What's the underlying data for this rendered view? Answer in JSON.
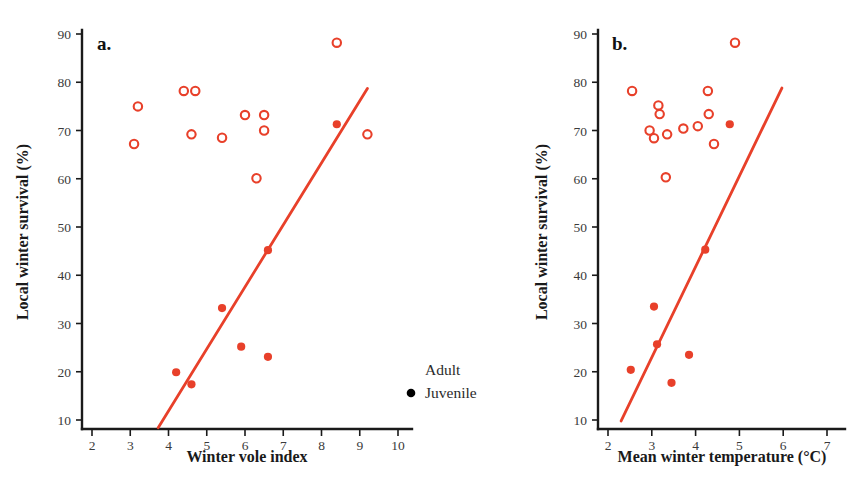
{
  "figure": {
    "accent_color": "#E8402A",
    "axis_color": "#1a1a1a",
    "text_color": "#2b2b2b"
  },
  "legend": {
    "adult_label": "Adult",
    "juvenile_label": "Juvenile",
    "adult_marker": "open-circle",
    "juvenile_marker": "filled-circle"
  },
  "chart_data": [
    {
      "type": "scatter",
      "panel": "a.",
      "title": "",
      "xlabel": "Winter vole index",
      "ylabel": "Local winter survival (%)",
      "xlim": [
        1.6,
        10.4
      ],
      "ylim": [
        8,
        92
      ],
      "xticks": [
        2,
        3,
        4,
        5,
        6,
        7,
        8,
        9,
        10
      ],
      "xticklabels": [
        "2",
        "3",
        "4",
        "5",
        "6",
        "7",
        "8",
        "9",
        "10"
      ],
      "yticks": [
        10,
        20,
        30,
        40,
        50,
        60,
        70,
        80,
        90
      ],
      "yticklabels": [
        "10",
        "20",
        "30",
        "40",
        "50",
        "60",
        "70",
        "80",
        "90"
      ],
      "grid": false,
      "legend_position": "outside-right",
      "series": [
        {
          "name": "Adult",
          "marker": "open-circle",
          "color": "#E8402A",
          "points": [
            {
              "x": 3.1,
              "y": 67.2
            },
            {
              "x": 3.2,
              "y": 75.0
            },
            {
              "x": 4.4,
              "y": 78.2
            },
            {
              "x": 4.7,
              "y": 78.2
            },
            {
              "x": 4.6,
              "y": 69.2
            },
            {
              "x": 5.4,
              "y": 68.5
            },
            {
              "x": 6.0,
              "y": 73.2
            },
            {
              "x": 6.5,
              "y": 73.2
            },
            {
              "x": 6.5,
              "y": 70.0
            },
            {
              "x": 6.3,
              "y": 60.1
            },
            {
              "x": 8.4,
              "y": 88.2
            },
            {
              "x": 9.2,
              "y": 69.2
            }
          ]
        },
        {
          "name": "Juvenile",
          "marker": "filled-circle",
          "color": "#E8402A",
          "points": [
            {
              "x": 4.2,
              "y": 19.9
            },
            {
              "x": 4.6,
              "y": 17.4
            },
            {
              "x": 5.4,
              "y": 33.2
            },
            {
              "x": 5.9,
              "y": 25.2
            },
            {
              "x": 6.6,
              "y": 23.1
            },
            {
              "x": 6.6,
              "y": 45.2
            },
            {
              "x": 8.4,
              "y": 71.3
            }
          ]
        }
      ],
      "fit_line": {
        "x1": 3.73,
        "y1": 8.4,
        "x2": 9.2,
        "y2": 78.7
      }
    },
    {
      "type": "scatter",
      "panel": "b.",
      "title": "",
      "xlabel": "Mean winter temperature (°C)",
      "ylabel": "Local winter survival (%)",
      "xlim": [
        1.75,
        7.5
      ],
      "ylim": [
        8,
        92
      ],
      "xticks": [
        2,
        3,
        4,
        5,
        6,
        7
      ],
      "xticklabels": [
        "2",
        "3",
        "4",
        "5",
        "6",
        "7"
      ],
      "yticks": [
        10,
        20,
        30,
        40,
        50,
        60,
        70,
        80,
        90
      ],
      "yticklabels": [
        "10",
        "20",
        "30",
        "40",
        "50",
        "60",
        "70",
        "80",
        "90"
      ],
      "grid": false,
      "legend_position": "outside-left",
      "series": [
        {
          "name": "Adult",
          "marker": "open-circle",
          "color": "#E8402A",
          "points": [
            {
              "x": 2.55,
              "y": 78.2
            },
            {
              "x": 3.15,
              "y": 75.2
            },
            {
              "x": 3.18,
              "y": 73.4
            },
            {
              "x": 2.95,
              "y": 70.0
            },
            {
              "x": 3.05,
              "y": 68.4
            },
            {
              "x": 3.35,
              "y": 69.2
            },
            {
              "x": 3.32,
              "y": 60.3
            },
            {
              "x": 3.72,
              "y": 70.4
            },
            {
              "x": 4.05,
              "y": 70.9
            },
            {
              "x": 4.28,
              "y": 78.2
            },
            {
              "x": 4.3,
              "y": 73.4
            },
            {
              "x": 4.42,
              "y": 67.2
            },
            {
              "x": 4.9,
              "y": 88.2
            }
          ]
        },
        {
          "name": "Juvenile",
          "marker": "filled-circle",
          "color": "#E8402A",
          "points": [
            {
              "x": 2.52,
              "y": 20.4
            },
            {
              "x": 3.05,
              "y": 33.5
            },
            {
              "x": 3.12,
              "y": 25.7
            },
            {
              "x": 3.45,
              "y": 17.7
            },
            {
              "x": 3.85,
              "y": 23.5
            },
            {
              "x": 4.22,
              "y": 45.3
            },
            {
              "x": 4.78,
              "y": 71.3
            }
          ]
        }
      ],
      "fit_line": {
        "x1": 2.3,
        "y1": 9.8,
        "x2": 5.97,
        "y2": 78.8
      }
    }
  ]
}
